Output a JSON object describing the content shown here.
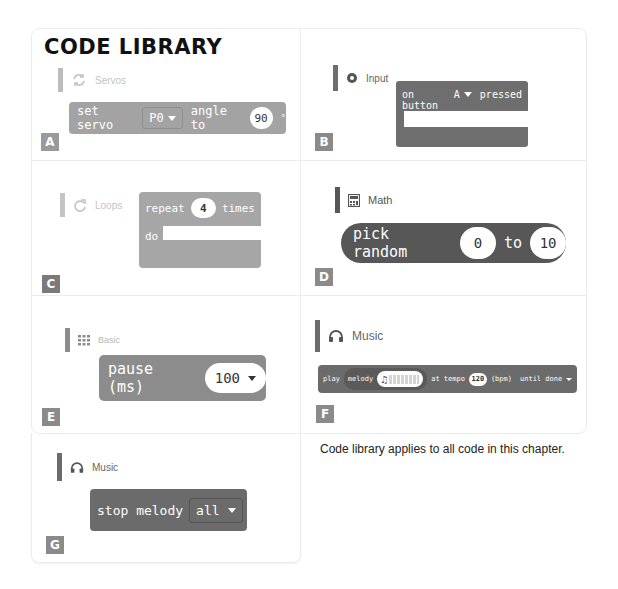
{
  "title": "CODE LIBRARY",
  "footnote": "Code library applies to all code in this chapter.",
  "colors": {
    "servos": "#a3a3a3",
    "input": "#6e6e6e",
    "loops": "#a6a6a6",
    "math": "#575757",
    "basic": "#8c8c8c",
    "music": "#6b6b6b",
    "label_light": "#9a9a9a",
    "label_dark": "#7a7a7a"
  },
  "panels": [
    {
      "id": "A",
      "category": "Servos",
      "icon": "refresh-icon",
      "block": {
        "text1": "set servo",
        "dropdown": "P0",
        "text2": "angle to",
        "value": "90",
        "unit": "°"
      }
    },
    {
      "id": "B",
      "category": "Input",
      "icon": "radio-button-icon",
      "block": {
        "text1": "on button",
        "dropdown": "A",
        "text2": "pressed"
      }
    },
    {
      "id": "C",
      "category": "Loops",
      "icon": "redo-icon",
      "block": {
        "text1": "repeat",
        "value": "4",
        "text2": "times",
        "text3": "do"
      }
    },
    {
      "id": "D",
      "category": "Math",
      "icon": "calculator-icon",
      "block": {
        "text1": "pick random",
        "value1": "0",
        "text2": "to",
        "value2": "10"
      }
    },
    {
      "id": "E",
      "category": "Basic",
      "icon": "grid-icon",
      "block": {
        "text1": "pause (ms)",
        "dropdown": "100"
      }
    },
    {
      "id": "F",
      "category": "Music",
      "icon": "headphones-icon",
      "block": {
        "text1": "play",
        "text2": "melody",
        "text3": "at tempo",
        "value": "120",
        "text4": "(bpm)",
        "dropdown": "until done"
      }
    },
    {
      "id": "G",
      "category": "Music",
      "icon": "headphones-icon",
      "block": {
        "text1": "stop melody",
        "dropdown": "all"
      }
    }
  ]
}
